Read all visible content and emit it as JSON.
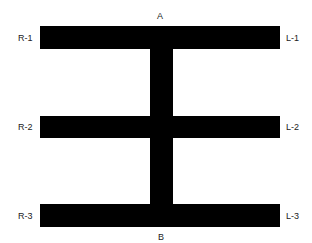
{
  "diagram": {
    "colors": {
      "bar": "#000000",
      "background": "#ffffff",
      "text": "#222222"
    },
    "labels": {
      "top": "A",
      "bottom": "B",
      "left": [
        "R-1",
        "R-2",
        "R-3"
      ],
      "right": [
        "L-1",
        "L-2",
        "L-3"
      ]
    },
    "bars": [
      {
        "name": "top-bar",
        "x": 40,
        "y": 26,
        "w": 240,
        "h": 23
      },
      {
        "name": "middle-bar",
        "x": 40,
        "y": 116,
        "w": 240,
        "h": 22
      },
      {
        "name": "bottom-bar",
        "x": 40,
        "y": 204,
        "w": 240,
        "h": 23
      },
      {
        "name": "vertical-stem",
        "x": 150,
        "y": 26,
        "w": 23,
        "h": 201
      }
    ]
  }
}
